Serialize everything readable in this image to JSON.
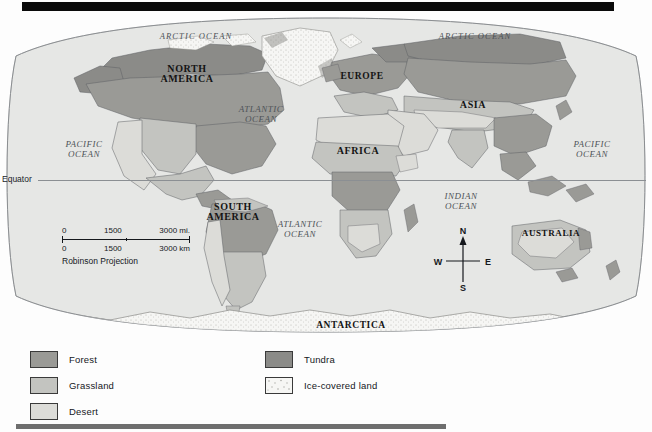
{
  "page": {
    "type": "world-thematic-map",
    "background_color": "#fdfdfd",
    "top_rule_color": "#0a0a0a",
    "bottom_rule_color": "#6e6e6e"
  },
  "map": {
    "projection_note": "Robinson Projection",
    "ocean_color": "#e3e4e2",
    "outline_color": "#7a7d80",
    "equator": {
      "label": "Equator",
      "line_color": "#8b8f93"
    },
    "continents": [
      {
        "name": "NORTH\nAMERICA",
        "line1": "NORTH",
        "line2": "AMERICA",
        "x": 186,
        "y": 62,
        "size": 10
      },
      {
        "name": "SOUTH\nAMERICA",
        "line1": "SOUTH",
        "line2": "AMERICA",
        "x": 232,
        "y": 198,
        "size": 10
      },
      {
        "name": "EUROPE",
        "line1": "EUROPE",
        "line2": "",
        "x": 362,
        "y": 75,
        "size": 9.5
      },
      {
        "name": "AFRICA",
        "line1": "AFRICA",
        "line2": "",
        "x": 358,
        "y": 150,
        "size": 10
      },
      {
        "name": "ASIA",
        "line1": "ASIA",
        "line2": "",
        "x": 473,
        "y": 104,
        "size": 10
      },
      {
        "name": "AUSTRALIA",
        "line1": "AUSTRALIA",
        "line2": "",
        "x": 551,
        "y": 233,
        "size": 9
      },
      {
        "name": "ANTARCTICA",
        "line1": "ANTARCTICA",
        "line2": "",
        "x": 351,
        "y": 326,
        "size": 9.5
      }
    ],
    "oceans": [
      {
        "name": "ARCTIC OCEAN",
        "line1": "ARCTIC OCEAN",
        "line2": "",
        "x": 194,
        "y": 24,
        "size": 8.5,
        "variant": "arctic"
      },
      {
        "name": "ARCTIC OCEAN",
        "line1": "ARCTIC OCEAN",
        "line2": "",
        "x": 473,
        "y": 24,
        "size": 8.5,
        "variant": "arctic"
      },
      {
        "name": "ATLANTIC OCEAN (north)",
        "line1": "ATLANTIC",
        "line2": "OCEAN",
        "x": 261,
        "y": 100,
        "size": 9
      },
      {
        "name": "ATLANTIC OCEAN (south)",
        "line1": "ATLANTIC",
        "line2": "OCEAN",
        "x": 300,
        "y": 215,
        "size": 9
      },
      {
        "name": "PACIFIC OCEAN (east)",
        "line1": "PACIFIC",
        "line2": "OCEAN",
        "x": 84,
        "y": 143,
        "size": 9
      },
      {
        "name": "PACIFIC OCEAN (west)",
        "line1": "PACIFIC",
        "line2": "OCEAN",
        "x": 592,
        "y": 143,
        "size": 9
      },
      {
        "name": "INDIAN OCEAN",
        "line1": "INDIAN",
        "line2": "OCEAN",
        "x": 461,
        "y": 197,
        "size": 9
      }
    ]
  },
  "scale": {
    "miles": {
      "ticks": [
        "0",
        "1500",
        "3000 mi."
      ]
    },
    "kilometers": {
      "ticks": [
        "0",
        "1500",
        "3000 km"
      ]
    },
    "projection": "Robinson Projection"
  },
  "compass": {
    "north": "N",
    "south": "S",
    "east": "E",
    "west": "W"
  },
  "legend": {
    "columns": [
      {
        "items": [
          {
            "label": "Forest",
            "color": "#9a9a96",
            "pattern": "solid"
          },
          {
            "label": "Grassland",
            "color": "#c3c4c0",
            "pattern": "solid"
          },
          {
            "label": "Desert",
            "color": "#dcdcd8",
            "pattern": "solid"
          }
        ]
      },
      {
        "items": [
          {
            "label": "Tundra",
            "color": "#8b8b88",
            "pattern": "solid"
          },
          {
            "label": "Ice-covered land",
            "color": "#f4f4f2",
            "pattern": "stipple"
          }
        ]
      }
    ]
  }
}
